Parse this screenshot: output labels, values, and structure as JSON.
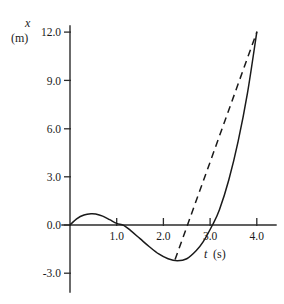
{
  "chart_data": {
    "type": "line",
    "title": "",
    "xlabel": "t (s)",
    "ylabel": "x (m)",
    "xlabel_symbol": "t",
    "xlabel_unit": "(s)",
    "ylabel_symbol": "x",
    "ylabel_unit": "(m)",
    "grid": false,
    "legend": "none",
    "xlim": [
      0.0,
      4.3
    ],
    "ylim": [
      -3.6,
      12.6
    ],
    "xticks": [
      1.0,
      2.0,
      3.0,
      4.0
    ],
    "xtick_labels": [
      "1.0",
      "2.0",
      "3.0",
      "4.0"
    ],
    "yticks": [
      -3.0,
      0.0,
      3.0,
      6.0,
      9.0,
      12.0
    ],
    "ytick_labels": [
      "-3.0",
      "0.0",
      "3.0",
      "6.0",
      "9.0",
      "12.0"
    ],
    "series": [
      {
        "name": "position-curve",
        "style": "solid",
        "color": "#1a1a1a",
        "x": [
          0.0,
          0.15,
          0.3,
          0.45,
          0.55,
          0.7,
          0.85,
          1.0,
          1.15,
          1.3,
          1.5,
          1.7,
          1.9,
          2.1,
          2.3,
          2.5,
          2.7,
          2.85,
          3.05,
          3.2,
          3.4,
          3.6,
          3.8,
          4.0
        ],
        "y": [
          0.0,
          0.4,
          0.62,
          0.7,
          0.68,
          0.55,
          0.33,
          0.1,
          -0.02,
          -0.35,
          -0.85,
          -1.35,
          -1.8,
          -2.1,
          -2.22,
          -2.1,
          -1.6,
          -1.05,
          0.0,
          0.95,
          2.8,
          5.2,
          8.2,
          12.0
        ]
      },
      {
        "name": "tangent-line",
        "style": "dashed",
        "color": "#1a1a1a",
        "x": [
          2.25,
          4.0
        ],
        "y": [
          -2.15,
          12.0
        ]
      }
    ],
    "annotations": [
      {
        "text": "x",
        "role": "y-axis-symbol",
        "italic": true
      },
      {
        "text": "(m)",
        "role": "y-axis-unit",
        "italic": false
      },
      {
        "text": "t",
        "role": "x-axis-symbol",
        "italic": true
      },
      {
        "text": "(s)",
        "role": "x-axis-unit",
        "italic": false
      }
    ]
  },
  "geometry": {
    "origin_x_px": 70,
    "origin_y_px": 225,
    "px_per_t_unit": 46.7,
    "px_per_x_unit": 16.08,
    "axis_top_px": 26,
    "axis_bottom_px": 292,
    "axis_right_px": 276,
    "tick_length_px": 6
  }
}
